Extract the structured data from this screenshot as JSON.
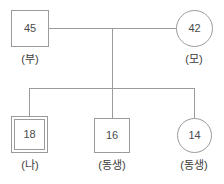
{
  "diagram": {
    "type": "pedigree",
    "line_color": "#9b9b9b",
    "text_color": "#3c3c3c",
    "background": "#ffffff",
    "generations": [
      {
        "name": "parents",
        "members": [
          {
            "id": "father",
            "shape": "square",
            "age": "45",
            "caption": "(부)",
            "double_border": false
          },
          {
            "id": "mother",
            "shape": "circle",
            "age": "42",
            "caption": "(모)",
            "double_border": false
          }
        ]
      },
      {
        "name": "children",
        "members": [
          {
            "id": "self",
            "shape": "square",
            "age": "18",
            "caption": "(나)",
            "double_border": true
          },
          {
            "id": "sibling-1",
            "shape": "square",
            "age": "16",
            "caption": "(동생)",
            "double_border": false
          },
          {
            "id": "sibling-2",
            "shape": "circle",
            "age": "14",
            "caption": "(동생)",
            "double_border": false
          }
        ]
      }
    ]
  }
}
